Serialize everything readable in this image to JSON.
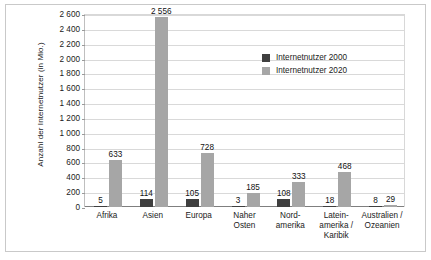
{
  "chart_data": {
    "type": "bar",
    "title": "",
    "subtitle": "",
    "xlabel": "",
    "ylabel": "Anzahl der Internetnutzer (in Mio.)",
    "ylim": [
      0,
      2600
    ],
    "ytick_step": 200,
    "yticks": [
      "0",
      "200",
      "400",
      "600",
      "800",
      "1 000",
      "1 200",
      "1 400",
      "1 600",
      "1 800",
      "2 000",
      "2 200",
      "2 400",
      "2 600"
    ],
    "grid": true,
    "legend_position": "inside-top-right",
    "categories": [
      "Afrika",
      "Asien",
      "Europa",
      "Naher\nOsten",
      "Nord-\namerika",
      "Latein-\namerika /\nKaribik",
      "Australien /\nOzeanien"
    ],
    "series": [
      {
        "name": "Internetnutzer 2000",
        "color": "#3f3f3f",
        "values": [
          5,
          114,
          105,
          3,
          108,
          18,
          8
        ],
        "labels": [
          "5",
          "114",
          "105",
          "3",
          "108",
          "18",
          "8"
        ]
      },
      {
        "name": "Internetnutzer 2020",
        "color": "#a6a6a6",
        "values": [
          633,
          2556,
          728,
          185,
          333,
          468,
          29
        ],
        "labels": [
          "633",
          "2 556",
          "728",
          "185",
          "333",
          "468",
          "29"
        ]
      }
    ]
  }
}
